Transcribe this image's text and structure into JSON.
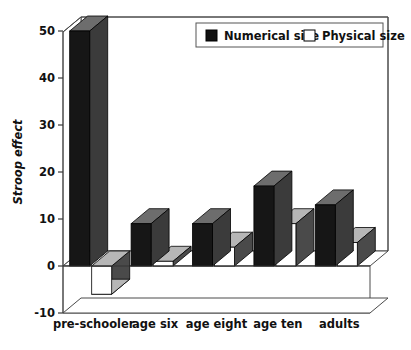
{
  "chart_data": {
    "type": "bar",
    "title": "",
    "subtitle": "",
    "xlabel": "",
    "ylabel": "Stroop effect",
    "categories": [
      "pre-schooler",
      "age six",
      "age eight",
      "age ten",
      "adults"
    ],
    "series": [
      {
        "name": "Numerical size",
        "values": [
          50,
          9,
          9,
          17,
          13
        ],
        "fill": "#161616",
        "style": "black-filled-3d-bar"
      },
      {
        "name": "Physical size",
        "values": [
          -6,
          1,
          4,
          9,
          5
        ],
        "fill": "#ffffff",
        "style": "white-outlined-3d-bar"
      }
    ],
    "ylim": [
      -10,
      52
    ],
    "yticks": [
      -10,
      0,
      10,
      20,
      30,
      40,
      50
    ],
    "ytick_labels": [
      "-10",
      "0",
      "10",
      "20",
      "30",
      "40",
      "50"
    ],
    "grid": false,
    "legend_position": "top-right-inside",
    "projection": "3d-extruded",
    "annotations": []
  },
  "axis": {
    "y_title": "Stroop effect",
    "ticks": [
      {
        "label": "50",
        "value": 50
      },
      {
        "label": "40",
        "value": 40
      },
      {
        "label": "30",
        "value": 30
      },
      {
        "label": "20",
        "value": 20
      },
      {
        "label": "10",
        "value": 10
      },
      {
        "label": "0",
        "value": 0
      },
      {
        "label": "-10",
        "value": -10
      }
    ]
  },
  "legend": {
    "entries": [
      {
        "label": "Numerical size",
        "swatch": "filled-black-square"
      },
      {
        "label": "Physical size",
        "swatch": "outlined-white-square"
      }
    ]
  },
  "categories": [
    {
      "label": "pre-schooler"
    },
    {
      "label": "age six"
    },
    {
      "label": "age eight"
    },
    {
      "label": "age ten"
    },
    {
      "label": "adults"
    }
  ]
}
